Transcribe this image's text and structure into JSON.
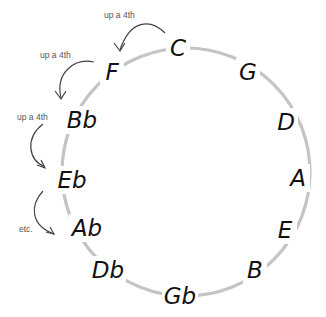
{
  "diagram": {
    "circle": {
      "cx": 186,
      "cy": 172,
      "r": 124,
      "stroke_color": "#c4c4c4"
    },
    "notes": [
      {
        "label": "C",
        "x": 178,
        "y": 48
      },
      {
        "label": "G",
        "x": 248,
        "y": 72
      },
      {
        "label": "D",
        "x": 286,
        "y": 122
      },
      {
        "label": "A",
        "x": 298,
        "y": 178
      },
      {
        "label": "E",
        "x": 285,
        "y": 230
      },
      {
        "label": "B",
        "x": 255,
        "y": 270
      },
      {
        "label": "Gb",
        "x": 180,
        "y": 296
      },
      {
        "label": "Db",
        "x": 108,
        "y": 270
      },
      {
        "label": "Ab",
        "x": 87,
        "y": 228
      },
      {
        "label": "Eb",
        "x": 72,
        "y": 180
      },
      {
        "label": "Bb",
        "x": 82,
        "y": 120
      },
      {
        "label": "F",
        "x": 112,
        "y": 72
      }
    ],
    "arrows": [
      {
        "label": "up a 4th",
        "from": "C",
        "to": "F"
      },
      {
        "label": "up a 4th",
        "from": "F",
        "to": "Bb"
      },
      {
        "label": "up a 4th",
        "from": "Bb",
        "to": "Eb"
      },
      {
        "label": "etc.",
        "from": "Eb",
        "to": "Ab"
      }
    ],
    "colors": {
      "note_text": "#111111",
      "arrow": "#444444",
      "arrow_text": "#555555"
    }
  }
}
